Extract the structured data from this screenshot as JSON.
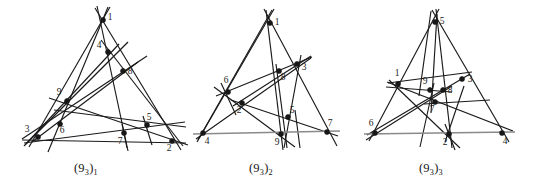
{
  "page": {
    "background_color": "#ffffff",
    "line_color": "#1a1a1a",
    "base_line_color": "#8a8a8a",
    "node_color": "#171717",
    "label_color": "#1c1c1c",
    "width": 540,
    "height": 184
  },
  "figures": [
    {
      "id": "fig-93-1",
      "caption_main": "(9",
      "caption_sub1": "3",
      "caption_mid": ")",
      "caption_sub2": "1",
      "caption_text": "(9_3)_1",
      "origin_x": 0,
      "nodes": [
        {
          "label": "1",
          "x": 103,
          "y": 20,
          "lx": 110,
          "ly": 20
        },
        {
          "label": "4",
          "x": 108,
          "y": 52,
          "lx": 99,
          "ly": 48
        },
        {
          "label": "8",
          "x": 123,
          "y": 71,
          "lx": 130,
          "ly": 74
        },
        {
          "label": "9",
          "x": 67,
          "y": 101,
          "lx": 59,
          "ly": 95
        },
        {
          "label": "6",
          "x": 60,
          "y": 124,
          "lx": 62,
          "ly": 133
        },
        {
          "label": "3",
          "x": 38,
          "y": 137,
          "lx": 27,
          "ly": 132
        },
        {
          "label": "7",
          "x": 124,
          "y": 133,
          "lx": 120,
          "ly": 144
        },
        {
          "label": "5",
          "x": 147,
          "y": 125,
          "lx": 149,
          "ly": 120
        },
        {
          "label": "2",
          "x": 172,
          "y": 141,
          "lx": 169,
          "ly": 151
        }
      ],
      "lines": [
        {
          "name": "line-1-4-7",
          "x1": 97,
          "y1": 6,
          "x2": 128,
          "y2": 151,
          "base": false
        },
        {
          "name": "line-1-8-2",
          "x1": 95,
          "y1": 8,
          "x2": 181,
          "y2": 150,
          "base": false
        },
        {
          "name": "line-1-9-3",
          "x1": 110,
          "y1": 7,
          "x2": 29,
          "y2": 147,
          "base": false
        },
        {
          "name": "line-1-6-5",
          "x1": 108,
          "y1": 7,
          "x2": 48,
          "y2": 152,
          "base": false
        },
        {
          "name": "line-4-9-6",
          "x1": 128,
          "y1": 42,
          "x2": 26,
          "y2": 144,
          "base": false
        },
        {
          "name": "line-4-3",
          "x1": 119,
          "y1": 44,
          "x2": 24,
          "y2": 146,
          "base": false
        },
        {
          "name": "line-8-6-3",
          "x1": 147,
          "y1": 56,
          "x2": 22,
          "y2": 139,
          "base": false
        },
        {
          "name": "line-9-7-2",
          "x1": 49,
          "y1": 98,
          "x2": 188,
          "y2": 145,
          "base": false
        },
        {
          "name": "line-9-5",
          "x1": 54,
          "y1": 110,
          "x2": 186,
          "y2": 127,
          "base": false
        },
        {
          "name": "line-3-7-5",
          "x1": 24,
          "y1": 143,
          "x2": 185,
          "y2": 122,
          "base": false
        },
        {
          "name": "line-3-2",
          "x1": 22,
          "y1": 140,
          "x2": 186,
          "y2": 143,
          "base": false
        },
        {
          "name": "line-4-8-2",
          "x1": 101,
          "y1": 40,
          "x2": 183,
          "y2": 146,
          "base": false
        },
        {
          "name": "line-8-9-lowleft",
          "x1": 138,
          "y1": 62,
          "x2": 32,
          "y2": 142,
          "base": false
        },
        {
          "name": "line-5-vert",
          "x1": 143,
          "y1": 116,
          "x2": 152,
          "y2": 145,
          "base": false
        },
        {
          "name": "line-7-vert",
          "x1": 122,
          "y1": 124,
          "x2": 127,
          "y2": 148,
          "base": false
        }
      ]
    },
    {
      "id": "fig-93-2",
      "caption_main": "(9",
      "caption_sub1": "3",
      "caption_mid": ")",
      "caption_sub2": "2",
      "caption_text": "(9_3)_2",
      "origin_x": 0,
      "nodes": [
        {
          "label": "1",
          "x": 270,
          "y": 23,
          "lx": 277,
          "ly": 25
        },
        {
          "label": "3",
          "x": 297,
          "y": 64,
          "lx": 304,
          "ly": 70
        },
        {
          "label": "8",
          "x": 279,
          "y": 71,
          "lx": 283,
          "ly": 80
        },
        {
          "label": "6",
          "x": 228,
          "y": 92,
          "lx": 226,
          "ly": 83
        },
        {
          "label": "2",
          "x": 242,
          "y": 103,
          "lx": 239,
          "ly": 113
        },
        {
          "label": "5",
          "x": 288,
          "y": 117,
          "lx": 292,
          "ly": 113
        },
        {
          "label": "9",
          "x": 281,
          "y": 134,
          "lx": 277,
          "ly": 145
        },
        {
          "label": "4",
          "x": 203,
          "y": 133,
          "lx": 207,
          "ly": 144
        },
        {
          "label": "7",
          "x": 327,
          "y": 132,
          "lx": 330,
          "ly": 126
        }
      ],
      "lines": [
        {
          "name": "line-1-8-9",
          "x1": 266,
          "y1": 10,
          "x2": 283,
          "y2": 150,
          "base": false
        },
        {
          "name": "line-1-3-7",
          "x1": 264,
          "y1": 9,
          "x2": 337,
          "y2": 146,
          "base": false
        },
        {
          "name": "line-1-6-4",
          "x1": 274,
          "y1": 9,
          "x2": 197,
          "y2": 142,
          "base": false
        },
        {
          "name": "line-1-2-4b",
          "x1": 272,
          "y1": 10,
          "x2": 198,
          "y2": 140,
          "base": false
        },
        {
          "name": "line-3-5-9",
          "x1": 301,
          "y1": 55,
          "x2": 284,
          "y2": 148,
          "base": false
        },
        {
          "name": "line-3-2-4",
          "x1": 311,
          "y1": 58,
          "x2": 196,
          "y2": 139,
          "base": false
        },
        {
          "name": "line-6-8-3",
          "x1": 216,
          "y1": 96,
          "x2": 312,
          "y2": 57,
          "base": false
        },
        {
          "name": "line-6-2-vert",
          "x1": 221,
          "y1": 83,
          "x2": 236,
          "y2": 115,
          "base": false
        },
        {
          "name": "line-6-9-lr",
          "x1": 214,
          "y1": 87,
          "x2": 295,
          "y2": 147,
          "base": false
        },
        {
          "name": "line-2-5-7",
          "x1": 231,
          "y1": 100,
          "x2": 338,
          "y2": 136,
          "base": false
        },
        {
          "name": "line-2-8-3r",
          "x1": 233,
          "y1": 106,
          "x2": 311,
          "y2": 56,
          "base": false
        },
        {
          "name": "line-8-9-vert",
          "x1": 276,
          "y1": 64,
          "x2": 287,
          "y2": 148,
          "base": false
        },
        {
          "name": "line-5-9-7",
          "x1": 295,
          "y1": 110,
          "x2": 300,
          "y2": 148,
          "base": false
        },
        {
          "name": "line-4-9-7",
          "x1": 193,
          "y1": 134,
          "x2": 340,
          "y2": 131,
          "base": true
        }
      ]
    },
    {
      "id": "fig-93-3",
      "caption_main": "(9",
      "caption_sub1": "3",
      "caption_mid": ")",
      "caption_sub2": "3",
      "caption_text": "(9_3)_3",
      "origin_x": 0,
      "nodes": [
        {
          "label": "5",
          "x": 435,
          "y": 22,
          "lx": 442,
          "ly": 24
        },
        {
          "label": "3",
          "x": 462,
          "y": 79,
          "lx": 470,
          "ly": 82
        },
        {
          "label": "1",
          "x": 398,
          "y": 84,
          "lx": 397,
          "ly": 76
        },
        {
          "label": "9",
          "x": 430,
          "y": 90,
          "lx": 425,
          "ly": 84
        },
        {
          "label": "8",
          "x": 443,
          "y": 90,
          "lx": 450,
          "ly": 93
        },
        {
          "label": "7",
          "x": 435,
          "y": 102,
          "lx": 432,
          "ly": 112
        },
        {
          "label": "6",
          "x": 375,
          "y": 133,
          "lx": 371,
          "ly": 126
        },
        {
          "label": "2",
          "x": 449,
          "y": 134,
          "lx": 445,
          "ly": 145
        },
        {
          "label": "4",
          "x": 502,
          "y": 133,
          "lx": 505,
          "ly": 144
        }
      ],
      "lines": [
        {
          "name": "line-5-9-6",
          "x1": 439,
          "y1": 9,
          "x2": 369,
          "y2": 141,
          "base": false
        },
        {
          "name": "line-5-7-2",
          "x1": 436,
          "y1": 9,
          "x2": 452,
          "y2": 148,
          "base": false
        },
        {
          "name": "line-5-3-4",
          "x1": 432,
          "y1": 10,
          "x2": 509,
          "y2": 142,
          "base": false
        },
        {
          "name": "line-5-1-vert",
          "x1": 431,
          "y1": 11,
          "x2": 419,
          "y2": 96,
          "base": false
        },
        {
          "name": "line-3-9-1",
          "x1": 472,
          "y1": 72,
          "x2": 388,
          "y2": 83,
          "base": false
        },
        {
          "name": "line-3-7-6",
          "x1": 470,
          "y1": 74,
          "x2": 367,
          "y2": 135,
          "base": false
        },
        {
          "name": "line-3-2",
          "x1": 464,
          "y1": 86,
          "x2": 445,
          "y2": 142,
          "base": false
        },
        {
          "name": "line-1-8-4",
          "x1": 387,
          "y1": 82,
          "x2": 513,
          "y2": 131,
          "base": false
        },
        {
          "name": "line-1-7-2",
          "x1": 389,
          "y1": 80,
          "x2": 460,
          "y2": 148,
          "base": false
        },
        {
          "name": "line-9-7-low",
          "x1": 434,
          "y1": 83,
          "x2": 420,
          "y2": 147,
          "base": false
        },
        {
          "name": "line-8-7-6",
          "x1": 452,
          "y1": 86,
          "x2": 366,
          "y2": 140,
          "base": false
        },
        {
          "name": "line-8-9-left",
          "x1": 452,
          "y1": 92,
          "x2": 386,
          "y2": 87,
          "base": false
        },
        {
          "name": "line-7-8-right",
          "x1": 424,
          "y1": 104,
          "x2": 490,
          "y2": 100,
          "base": false
        },
        {
          "name": "line-5-9-7-vert",
          "x1": 437,
          "y1": 14,
          "x2": 431,
          "y2": 113,
          "base": false
        },
        {
          "name": "line-2-vert",
          "x1": 445,
          "y1": 124,
          "x2": 455,
          "y2": 150,
          "base": false
        },
        {
          "name": "line-6-2-4",
          "x1": 364,
          "y1": 134,
          "x2": 515,
          "y2": 132,
          "base": true
        }
      ]
    }
  ],
  "captions": [
    {
      "text": "(9",
      "sub1": "3",
      "mid": ")",
      "sub2": "1",
      "x": 74,
      "y": 161
    },
    {
      "text": "(9",
      "sub1": "3",
      "mid": ")",
      "sub2": "2",
      "x": 249,
      "y": 161
    },
    {
      "text": "(9",
      "sub1": "3",
      "mid": ")",
      "sub2": "3",
      "x": 419,
      "y": 161
    }
  ]
}
